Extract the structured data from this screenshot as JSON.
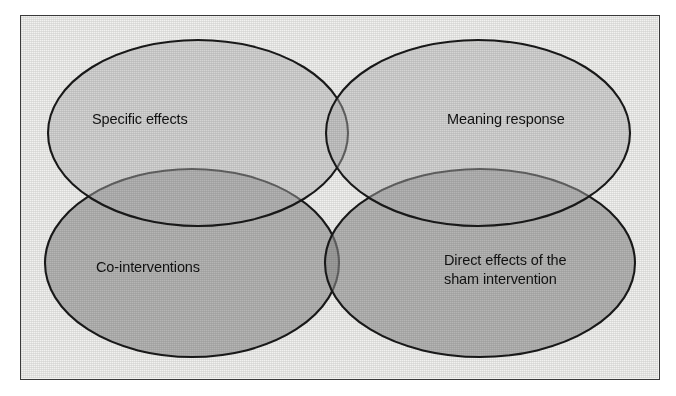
{
  "figure": {
    "type": "venn-diagram",
    "set_count": 4,
    "background_color": "#f2f2f0",
    "frame_color": "#3a3a3a",
    "outline_color": "#1a1a1a",
    "fill_light": "#d7d7d7",
    "fill_dark": "#a8a8a8",
    "sets": [
      {
        "id": "specific-effects",
        "label": "Specific effects",
        "position": "top-left",
        "fill": "#d7d7d7",
        "cx": 198,
        "cy": 133,
        "rx": 150,
        "ry": 93
      },
      {
        "id": "meaning-response",
        "label": "Meaning response",
        "position": "top-right",
        "fill": "#d7d7d7",
        "cx": 478,
        "cy": 133,
        "rx": 152,
        "ry": 93
      },
      {
        "id": "co-interventions",
        "label": "Co-interventions",
        "position": "bottom-left",
        "fill": "#a8a8a8",
        "cx": 192,
        "cy": 263,
        "rx": 147,
        "ry": 94
      },
      {
        "id": "direct-effects-sham",
        "label": "Direct effects of the\nsham intervention",
        "position": "bottom-right",
        "fill": "#a8a8a8",
        "cx": 480,
        "cy": 263,
        "rx": 155,
        "ry": 94
      }
    ]
  },
  "chart_data": {
    "type": "venn",
    "title": "",
    "categories": [
      "Specific effects",
      "Meaning response",
      "Co-interventions",
      "Direct effects of the sham intervention"
    ],
    "values": [
      1,
      1,
      1,
      1
    ],
    "legend": "none",
    "grid": false
  }
}
